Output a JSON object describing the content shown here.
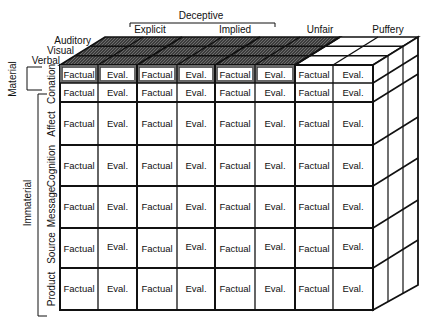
{
  "top_groups": [
    {
      "label": "Deceptive",
      "subgroups": [
        "Explicit",
        "Implied"
      ]
    },
    {
      "label": "Unfair"
    },
    {
      "label": "Puffery"
    }
  ],
  "column_headers": [
    "Explicit",
    "Implied",
    "Unfair",
    "Puffery"
  ],
  "depth_labels": [
    "Auditory",
    "Visual",
    "Verbal"
  ],
  "row_groups": [
    {
      "label": "Material",
      "rows": [
        "Conation (material)"
      ]
    },
    {
      "label": "Immaterial",
      "rows": [
        "Conation",
        "Affect",
        "Cognition",
        "Message",
        "Source",
        "Product"
      ]
    }
  ],
  "row_labels": [
    "Conation",
    "Affect",
    "Cognition",
    "Message",
    "Source",
    "Product"
  ],
  "cell_pair": [
    "Factual",
    "Eval."
  ],
  "colors": {
    "shaded_top": "#4a4a4a",
    "shaded_border": "#6b6b6b",
    "line": "#111111",
    "cell_bg": "#ffffff"
  }
}
